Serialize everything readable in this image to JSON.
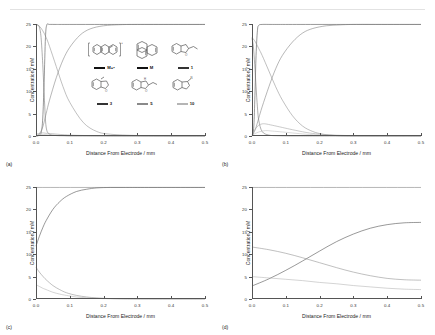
{
  "figure": {
    "panels": [
      {
        "tag": "(a)"
      },
      {
        "tag": "(b)"
      },
      {
        "tag": "(c)"
      },
      {
        "tag": "(d)"
      }
    ],
    "axis": {
      "xlabel": "Distance From Electrode / mm",
      "ylabel": "Concentration / mM",
      "xticks": [
        "0.0",
        "0.1",
        "0.2",
        "0.3",
        "0.4",
        "0.5"
      ],
      "yticks": [
        "0",
        "5",
        "10",
        "15",
        "20",
        "25"
      ]
    },
    "legend": {
      "items": [
        {
          "label": "M+•",
          "style": "thick",
          "structure": "anthracene-radical-cation"
        },
        {
          "label": "M",
          "style": "thick",
          "structure": "anthracene"
        },
        {
          "label": "1",
          "style": "thin",
          "structure": "compound-1"
        },
        {
          "label": "3",
          "style": "thin",
          "structure": "compound-3"
        },
        {
          "label": "5",
          "style": "grey",
          "structure": "compound-5"
        },
        {
          "label": "10",
          "style": "lgrey",
          "structure": "compound-10"
        }
      ]
    }
  },
  "chart_data": {
    "type": "line",
    "title": "",
    "xlabel": "Distance From Electrode / mm",
    "ylabel": "Concentration / mM",
    "xlim": [
      0.0,
      0.5
    ],
    "ylim": [
      0,
      25
    ],
    "xticks": [
      0.0,
      0.1,
      0.2,
      0.3,
      0.4,
      0.5
    ],
    "yticks": [
      0,
      5,
      10,
      15,
      20,
      25
    ],
    "grid": false,
    "legend_position": "inset-upper-center",
    "panels": [
      {
        "tag": "(a)",
        "series": [
          {
            "name": "M+•",
            "color": "#444444",
            "x": [
              0.0,
              0.004,
              0.008,
              0.012,
              0.016,
              0.02,
              0.024,
              0.028,
              0.032,
              0.04,
              0.06,
              0.1,
              0.2,
              0.3,
              0.5
            ],
            "y": [
              0.0,
              0.0,
              0.1,
              0.3,
              1.0,
              4.0,
              12.0,
              22.0,
              24.8,
              24.9,
              24.9,
              24.9,
              24.9,
              24.9,
              24.9
            ]
          },
          {
            "name": "M",
            "color": "#6d6d6d",
            "x": [
              0.0,
              0.005,
              0.01,
              0.015,
              0.02,
              0.025,
              0.03,
              0.04,
              0.06,
              0.08,
              0.1,
              0.15,
              0.2,
              0.3,
              0.5
            ],
            "y": [
              24.9,
              24.8,
              24.3,
              22.0,
              16.0,
              8.0,
              2.0,
              0.4,
              0.1,
              0.05,
              0.0,
              0.0,
              0.0,
              0.0,
              0.0
            ]
          },
          {
            "name": "1",
            "color": "#7a7a7a",
            "x": [
              0.0,
              0.01,
              0.02,
              0.03,
              0.04,
              0.06,
              0.08,
              0.1,
              0.13,
              0.16,
              0.2,
              0.25,
              0.3,
              0.4,
              0.5
            ],
            "y": [
              0.0,
              0.5,
              2.0,
              5.0,
              8.0,
              13.0,
              17.0,
              19.8,
              22.5,
              23.9,
              24.6,
              24.85,
              24.9,
              24.9,
              24.9
            ]
          },
          {
            "name": "3",
            "color": "#8b8b8b",
            "x": [
              0.0,
              0.01,
              0.02,
              0.03,
              0.04,
              0.06,
              0.08,
              0.1,
              0.14,
              0.18,
              0.22,
              0.3,
              0.4,
              0.5
            ],
            "y": [
              24.9,
              24.5,
              23.5,
              22.0,
              20.0,
              15.5,
              11.0,
              7.5,
              3.0,
              1.0,
              0.4,
              0.1,
              0.0,
              0.0
            ]
          },
          {
            "name": "5",
            "color": "#a0a0a0",
            "x": [
              0.0,
              0.01,
              0.02,
              0.03,
              0.05,
              0.08,
              0.12,
              0.2,
              0.3,
              0.5
            ],
            "y": [
              0.4,
              0.6,
              0.7,
              0.6,
              0.5,
              0.3,
              0.15,
              0.05,
              0.0,
              0.0
            ]
          },
          {
            "name": "10",
            "color": "#bdbdbd",
            "x": [
              0.0,
              0.01,
              0.02,
              0.03,
              0.05,
              0.08,
              0.12,
              0.2,
              0.3,
              0.5
            ],
            "y": [
              0.2,
              0.3,
              0.35,
              0.3,
              0.25,
              0.15,
              0.08,
              0.02,
              0.0,
              0.0
            ]
          }
        ]
      },
      {
        "tag": "(b)",
        "series": [
          {
            "name": "M+•",
            "color": "#444444",
            "x": [
              0.0,
              0.003,
              0.006,
              0.009,
              0.012,
              0.016,
              0.02,
              0.03,
              0.06,
              0.12,
              0.25,
              0.5
            ],
            "y": [
              0.0,
              0.5,
              3.0,
              10.0,
              18.0,
              23.5,
              24.7,
              24.9,
              24.9,
              24.9,
              24.9,
              24.9
            ]
          },
          {
            "name": "M",
            "color": "#6d6d6d",
            "x": [
              0.0,
              0.004,
              0.008,
              0.012,
              0.016,
              0.02,
              0.03,
              0.05,
              0.08,
              0.12,
              0.2,
              0.5
            ],
            "y": [
              21.8,
              20.0,
              16.0,
              11.0,
              6.5,
              3.5,
              1.0,
              0.2,
              0.05,
              0.0,
              0.0,
              0.0
            ]
          },
          {
            "name": "1",
            "color": "#7a7a7a",
            "x": [
              0.0,
              0.01,
              0.02,
              0.03,
              0.05,
              0.07,
              0.09,
              0.12,
              0.15,
              0.18,
              0.22,
              0.26,
              0.3,
              0.4,
              0.5
            ],
            "y": [
              0.0,
              1.5,
              4.0,
              6.5,
              11.0,
              15.0,
              18.0,
              21.0,
              23.0,
              24.0,
              24.6,
              24.8,
              24.9,
              24.9,
              24.9
            ]
          },
          {
            "name": "3",
            "color": "#8b8b8b",
            "x": [
              0.0,
              0.01,
              0.02,
              0.03,
              0.05,
              0.07,
              0.09,
              0.12,
              0.15,
              0.18,
              0.21,
              0.25,
              0.3,
              0.5
            ],
            "y": [
              22.0,
              21.0,
              19.5,
              18.0,
              14.5,
              11.0,
              8.0,
              4.5,
              2.2,
              1.0,
              0.4,
              0.1,
              0.0,
              0.0
            ]
          },
          {
            "name": "5",
            "color": "#a0a0a0",
            "x": [
              0.0,
              0.01,
              0.02,
              0.03,
              0.04,
              0.06,
              0.09,
              0.12,
              0.16,
              0.2,
              0.26,
              0.35,
              0.5
            ],
            "y": [
              0.3,
              1.6,
              2.4,
              2.7,
              2.7,
              2.4,
              1.9,
              1.4,
              0.8,
              0.4,
              0.15,
              0.03,
              0.0
            ]
          },
          {
            "name": "10",
            "color": "#bdbdbd",
            "x": [
              0.0,
              0.02,
              0.04,
              0.06,
              0.09,
              0.13,
              0.17,
              0.22,
              0.3,
              0.5
            ],
            "y": [
              0.2,
              0.9,
              1.2,
              1.1,
              0.9,
              0.6,
              0.35,
              0.15,
              0.04,
              0.0
            ]
          }
        ]
      },
      {
        "tag": "(c)",
        "series": [
          {
            "name": "M+•",
            "color": "#444444",
            "x": [
              0.0,
              0.01,
              0.02,
              0.03,
              0.05,
              0.07,
              0.09,
              0.12,
              0.15,
              0.18,
              0.22,
              0.26,
              0.3,
              0.4,
              0.5
            ],
            "y": [
              11.8,
              14.0,
              15.9,
              17.5,
              20.0,
              21.7,
              22.9,
              24.0,
              24.5,
              24.8,
              24.9,
              24.9,
              24.9,
              24.9,
              24.9
            ]
          },
          {
            "name": "M",
            "color": "#8b8b8b",
            "x": [
              0.0,
              0.01,
              0.02,
              0.03,
              0.05,
              0.07,
              0.09,
              0.12,
              0.15,
              0.18,
              0.22,
              0.3,
              0.5
            ],
            "y": [
              7.1,
              6.0,
              5.1,
              4.3,
              3.0,
              2.1,
              1.4,
              0.8,
              0.45,
              0.25,
              0.1,
              0.02,
              0.0
            ]
          },
          {
            "name": "1",
            "color": "#b0b0b0",
            "x": [
              0.0,
              0.01,
              0.02,
              0.03,
              0.05,
              0.07,
              0.09,
              0.12,
              0.15,
              0.18,
              0.22,
              0.3,
              0.5
            ],
            "y": [
              3.2,
              2.8,
              2.4,
              2.1,
              1.5,
              1.1,
              0.8,
              0.45,
              0.25,
              0.14,
              0.06,
              0.01,
              0.0
            ]
          },
          {
            "name": "top-line",
            "color": "#777777",
            "x": [
              0.0,
              0.5
            ],
            "y": [
              24.9,
              24.9
            ]
          }
        ]
      },
      {
        "tag": "(d)",
        "series": [
          {
            "name": "M+•",
            "color": "#444444",
            "x": [
              0.0,
              0.05,
              0.1,
              0.15,
              0.2,
              0.25,
              0.3,
              0.35,
              0.4,
              0.45,
              0.5
            ],
            "y": [
              2.9,
              4.5,
              6.4,
              8.5,
              10.7,
              12.8,
              14.5,
              15.8,
              16.6,
              17.0,
              17.1
            ]
          },
          {
            "name": "M",
            "color": "#8b8b8b",
            "x": [
              0.0,
              0.05,
              0.1,
              0.15,
              0.2,
              0.25,
              0.3,
              0.35,
              0.4,
              0.45,
              0.5
            ],
            "y": [
              11.6,
              11.0,
              10.2,
              9.2,
              8.1,
              7.0,
              6.0,
              5.2,
              4.6,
              4.3,
              4.2
            ]
          },
          {
            "name": "1",
            "color": "#b0b0b0",
            "x": [
              0.0,
              0.05,
              0.1,
              0.15,
              0.2,
              0.25,
              0.3,
              0.35,
              0.4,
              0.45,
              0.5
            ],
            "y": [
              5.0,
              4.7,
              4.4,
              4.1,
              3.7,
              3.4,
              3.0,
              2.7,
              2.4,
              2.2,
              2.1
            ]
          },
          {
            "name": "top-line",
            "color": "#777777",
            "x": [
              0.0,
              0.5
            ],
            "y": [
              24.9,
              24.9
            ]
          }
        ]
      }
    ]
  }
}
